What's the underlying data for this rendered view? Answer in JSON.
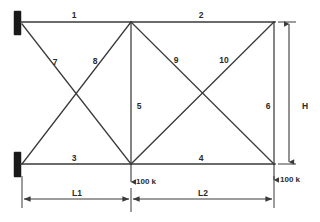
{
  "diagram": {
    "members": [
      {
        "id": "1",
        "label": "1",
        "x": 74,
        "y": 18,
        "desc": "top-chord-left"
      },
      {
        "id": "2",
        "label": "2",
        "x": 201,
        "y": 18,
        "desc": "top-chord-right"
      },
      {
        "id": "3",
        "label": "3",
        "x": 74,
        "y": 161,
        "desc": "bottom-chord-left"
      },
      {
        "id": "4",
        "label": "4",
        "x": 201,
        "y": 161,
        "desc": "bottom-chord-right"
      },
      {
        "id": "5",
        "label": "5",
        "x": 137,
        "y": 106,
        "desc": "center-vertical"
      },
      {
        "id": "6",
        "label": "6",
        "x": 268,
        "y": 106,
        "desc": "right-vertical"
      },
      {
        "id": "7",
        "label": "7",
        "x": 55,
        "y": 63,
        "desc": "left-panel-diagonal-down"
      },
      {
        "id": "8",
        "label": "8",
        "x": 95,
        "y": 62,
        "desc": "left-panel-diagonal-up"
      },
      {
        "id": "9",
        "label": "9",
        "x": 176,
        "y": 61,
        "desc": "right-panel-diagonal-down"
      },
      {
        "id": "10",
        "label": "10",
        "x": 222,
        "y": 61,
        "desc": "right-panel-diagonal-up"
      }
    ],
    "dimensions": [
      {
        "id": "L1",
        "label": "L1",
        "x": 77,
        "y": 200,
        "desc": "left-span"
      },
      {
        "id": "L2",
        "label": "L2",
        "x": 203,
        "y": 200,
        "desc": "right-span"
      },
      {
        "id": "H",
        "label": "H",
        "x": 303,
        "y": 106,
        "desc": "truss-height"
      }
    ],
    "loads": [
      {
        "id": "load-center",
        "label": "100 k",
        "x": 138,
        "y": 185,
        "desc": "center-bottom-joint-load"
      },
      {
        "id": "load-right",
        "label": "100 k",
        "x": 283,
        "y": 182,
        "desc": "right-bottom-joint-load"
      }
    ],
    "nodes": [
      {
        "id": "top-left",
        "x": 22,
        "y": 22
      },
      {
        "id": "top-center",
        "x": 131,
        "y": 22
      },
      {
        "id": "top-right",
        "x": 274,
        "y": 22
      },
      {
        "id": "bottom-left",
        "x": 22,
        "y": 164
      },
      {
        "id": "bottom-center",
        "x": 131,
        "y": 164
      },
      {
        "id": "bottom-right",
        "x": 274,
        "y": 164
      }
    ],
    "supports": [
      {
        "id": "support-top-left",
        "x": 14,
        "y": 11,
        "desc": "fixed-support-upper"
      },
      {
        "id": "support-bottom-left",
        "x": 14,
        "y": 152,
        "desc": "fixed-support-lower"
      }
    ],
    "colors": {
      "line": "#3a3a3a",
      "support": "#1a1a1a",
      "text": "#2a2a2a",
      "background": "#ffffff"
    }
  }
}
